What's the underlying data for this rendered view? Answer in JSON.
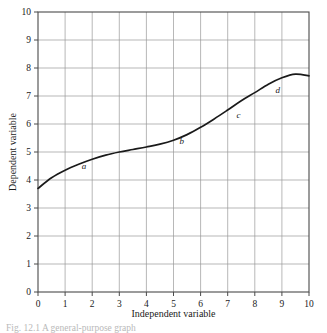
{
  "figure": {
    "caption_partial": "Fig. 12.1  A general-purpose graph",
    "caption_visible": "partially cropped at bottom edge"
  },
  "chart_data": {
    "type": "line",
    "title": "",
    "subtitle": "",
    "xlabel": "Independent variable",
    "ylabel": "Dependent variable",
    "xlim": [
      0,
      10
    ],
    "ylim": [
      0,
      10
    ],
    "xticks": [
      "0",
      "1",
      "2",
      "3",
      "4",
      "5",
      "6",
      "7",
      "8",
      "9",
      "10"
    ],
    "yticks": [
      "0",
      "1",
      "2",
      "3",
      "4",
      "5",
      "6",
      "7",
      "8",
      "9",
      "10"
    ],
    "grid": "both",
    "legend": "none",
    "series": [
      {
        "name": "curve",
        "x": [
          0,
          0.5,
          1,
          1.5,
          2,
          2.5,
          3,
          3.5,
          4,
          4.5,
          5,
          5.5,
          6,
          6.5,
          7,
          7.5,
          8,
          8.5,
          9,
          9.5,
          10
        ],
        "y": [
          3.7,
          4.08,
          4.35,
          4.56,
          4.74,
          4.89,
          5.0,
          5.09,
          5.18,
          5.28,
          5.42,
          5.62,
          5.88,
          6.18,
          6.5,
          6.83,
          7.12,
          7.42,
          7.65,
          7.78,
          7.72
        ]
      }
    ],
    "annotations": [
      {
        "label": "a",
        "x": 1.7,
        "y": 4.38
      },
      {
        "label": "b",
        "x": 5.3,
        "y": 5.28
      },
      {
        "label": "c",
        "x": 7.4,
        "y": 6.22
      },
      {
        "label": "d",
        "x": 8.85,
        "y": 7.12
      }
    ]
  },
  "axes": {
    "x_tick_values": [
      0,
      1,
      2,
      3,
      4,
      5,
      6,
      7,
      8,
      9,
      10
    ],
    "y_tick_values": [
      0,
      1,
      2,
      3,
      4,
      5,
      6,
      7,
      8,
      9,
      10
    ]
  },
  "colors": {
    "curve": "#1a1a1a",
    "grid": "#9a9a9a",
    "axis": "#4a4a4a",
    "text": "#1a1a1a",
    "background": "#ffffff"
  }
}
